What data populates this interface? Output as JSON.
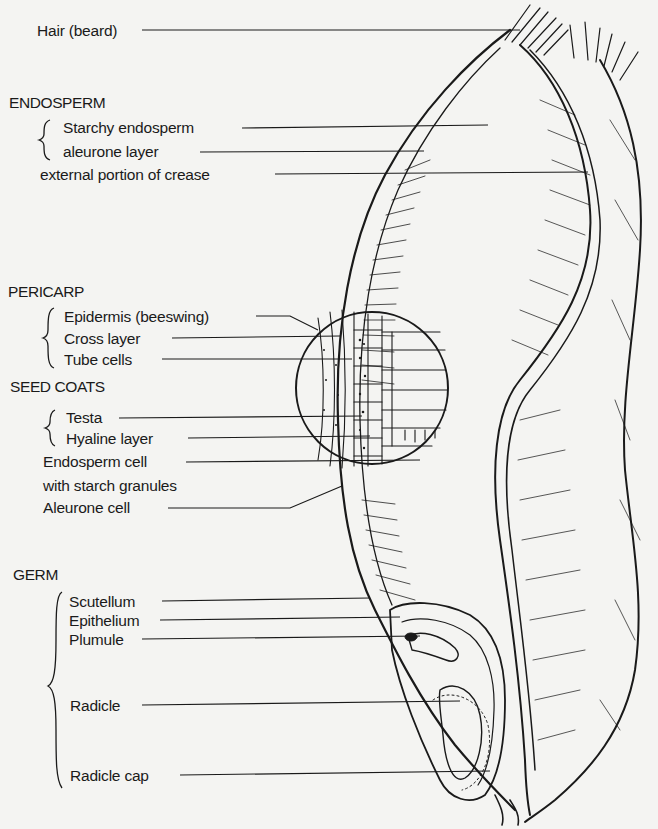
{
  "diagram": {
    "standalone_labels": {
      "hair": "Hair (beard)",
      "crease": "external portion of crease"
    },
    "sections": [
      {
        "name": "ENDOSPERM",
        "items": [
          "Starchy endosperm",
          "aleurone layer"
        ]
      },
      {
        "name": "PERICARP",
        "items": [
          "Epidermis (beeswing)",
          "Cross layer",
          "Tube cells"
        ]
      },
      {
        "name": "SEED COATS",
        "items": [
          "Testa",
          "Hyaline layer"
        ]
      },
      {
        "name": "GERM",
        "items": [
          "Scutellum",
          "Epithelium",
          "Plumule",
          "Radicle",
          "Radicle cap"
        ]
      }
    ],
    "extra_labels": {
      "endosperm_cell_line1": "Endosperm cell",
      "endosperm_cell_line2": "with starch granules",
      "aleurone_cell": "Aleurone cell"
    },
    "colors": {
      "ink": "#1a1a1a",
      "paper": "#f4f4f2"
    }
  }
}
